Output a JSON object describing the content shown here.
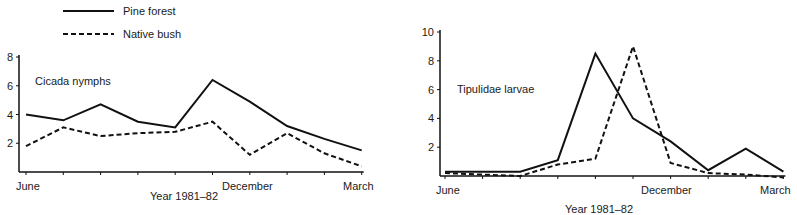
{
  "legend": {
    "items": [
      {
        "label": "Pine forest",
        "style": "solid"
      },
      {
        "label": "Native bush",
        "style": "dashed"
      }
    ]
  },
  "chart_data": [
    {
      "type": "line",
      "title": "Cicada nymphs",
      "xlabel": "Year 1981-82",
      "ylabel": "",
      "ylim": [
        0,
        8
      ],
      "yticks": [
        2,
        4,
        6,
        8
      ],
      "x": [
        1,
        2,
        3,
        4,
        5,
        6,
        7,
        8,
        9,
        10
      ],
      "x_tick_labels": {
        "1": "June",
        "6": "December",
        "10": "March"
      },
      "grid": false,
      "legend_position": "top-left above chart",
      "series": [
        {
          "name": "Pine forest",
          "style": "solid",
          "values": [
            4.0,
            3.6,
            4.7,
            3.5,
            3.1,
            6.4,
            4.9,
            3.2,
            2.3,
            1.5
          ]
        },
        {
          "name": "Native bush",
          "style": "dashed",
          "values": [
            1.8,
            3.1,
            2.5,
            2.7,
            2.8,
            3.5,
            1.2,
            2.7,
            1.3,
            0.4
          ]
        }
      ]
    },
    {
      "type": "line",
      "title": "Tipulidae larvae",
      "xlabel": "Year 1981-82",
      "ylabel": "",
      "ylim": [
        0,
        10
      ],
      "yticks": [
        2,
        4,
        6,
        8,
        10
      ],
      "x": [
        1,
        2,
        3,
        4,
        5,
        6,
        7,
        8,
        9,
        10
      ],
      "x_tick_labels": {
        "1": "June",
        "6": "December",
        "10": "March"
      },
      "grid": false,
      "series": [
        {
          "name": "Pine forest",
          "style": "solid",
          "values": [
            0.3,
            0.3,
            0.3,
            1.1,
            8.5,
            4.0,
            2.4,
            0.4,
            1.9,
            0.3
          ]
        },
        {
          "name": "Native bush",
          "style": "dashed",
          "values": [
            0.2,
            0.1,
            0.0,
            0.8,
            1.2,
            9.0,
            0.9,
            0.2,
            0.1,
            -0.1
          ]
        }
      ]
    }
  ]
}
